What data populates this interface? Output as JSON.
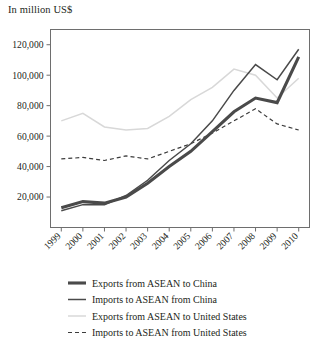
{
  "header": {
    "units_note": "In million US$"
  },
  "chart_data": {
    "type": "line",
    "title": "",
    "subtitle": "",
    "xlabel": "",
    "ylabel": "In million US$",
    "categories": [
      "1999",
      "2000",
      "2001",
      "2002",
      "2003",
      "2004",
      "2005",
      "2006",
      "2007",
      "2008",
      "2009",
      "2010"
    ],
    "x": [
      1999,
      2000,
      2001,
      2002,
      2003,
      2004,
      2005,
      2006,
      2007,
      2008,
      2009,
      2010
    ],
    "ylim": [
      0,
      130000
    ],
    "yticks": [
      20000,
      40000,
      60000,
      80000,
      100000,
      120000
    ],
    "ytick_labels": [
      "20,000",
      "40,000",
      "60,000",
      "80,000",
      "100,000",
      "120,000"
    ],
    "grid": false,
    "legend_position": "bottom",
    "series": [
      {
        "name": "Exports from ASEAN to China",
        "key": "exports_asean_china",
        "color": "#4a4a4a",
        "width": 3.1,
        "dash": "",
        "values": [
          13000,
          17000,
          16000,
          20000,
          29000,
          40000,
          50000,
          63000,
          76000,
          85000,
          82000,
          112000
        ]
      },
      {
        "name": "Imports to ASEAN from China",
        "key": "imports_asean_china",
        "color": "#4a4a4a",
        "width": 1.5,
        "dash": "",
        "values": [
          11000,
          15000,
          15000,
          21000,
          31000,
          44000,
          55000,
          70000,
          90000,
          107000,
          97000,
          117000
        ]
      },
      {
        "name": "Exports from ASEAN to United States",
        "key": "exports_asean_us",
        "color": "#d8d8d8",
        "width": 1.5,
        "dash": "",
        "values": [
          70000,
          75000,
          66000,
          64000,
          65000,
          73000,
          84000,
          92000,
          104000,
          100000,
          85000,
          98000
        ]
      },
      {
        "name": "Imports to ASEAN from United States",
        "key": "imports_asean_us",
        "color": "#3c3c3c",
        "width": 1.2,
        "dash": "4,3",
        "values": [
          45000,
          46000,
          44000,
          47000,
          45000,
          50000,
          55000,
          62000,
          70000,
          78000,
          68000,
          64000
        ]
      }
    ]
  },
  "legend": {
    "items": [
      {
        "label": "Exports from ASEAN to China",
        "swatch": "thick-solid-dark"
      },
      {
        "label": "Imports to ASEAN from China",
        "swatch": "solid-dark"
      },
      {
        "label": "Exports from ASEAN to United States",
        "swatch": "solid-light"
      },
      {
        "label": "Imports to ASEAN from United States",
        "swatch": "dashed-dark"
      }
    ]
  }
}
